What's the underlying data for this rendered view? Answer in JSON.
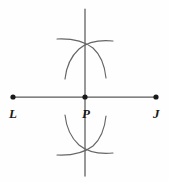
{
  "figure": {
    "background_color": "#fefefe",
    "line_color": "#5a5a5a",
    "arc_color": "#666666",
    "point_color": "#1a1a1a"
  },
  "labels": {
    "left_point": "L",
    "mid_point": "P",
    "right_point": "J"
  },
  "points": [
    {
      "name": "L",
      "label": "L",
      "x": 13,
      "y": 97
    },
    {
      "name": "P",
      "label": "P",
      "x": 85,
      "y": 97
    },
    {
      "name": "J",
      "label": "J",
      "x": 156,
      "y": 97
    }
  ],
  "segments": [
    {
      "name": "segment-LJ",
      "x1": 13,
      "y1": 97,
      "x2": 156,
      "y2": 97
    },
    {
      "name": "perpendicular-line",
      "x1": 85,
      "y1": 9,
      "x2": 85,
      "y2": 176
    }
  ],
  "arcs": [
    {
      "name": "upper-left-arc",
      "center": "L",
      "bulge": "right",
      "crosses_at_y": 42
    },
    {
      "name": "upper-right-arc",
      "center": "J",
      "bulge": "left",
      "crosses_at_y": 42
    },
    {
      "name": "lower-left-arc",
      "center": "L",
      "bulge": "right",
      "crosses_at_y": 152
    },
    {
      "name": "lower-right-arc",
      "center": "J",
      "bulge": "left",
      "crosses_at_y": 152
    }
  ]
}
